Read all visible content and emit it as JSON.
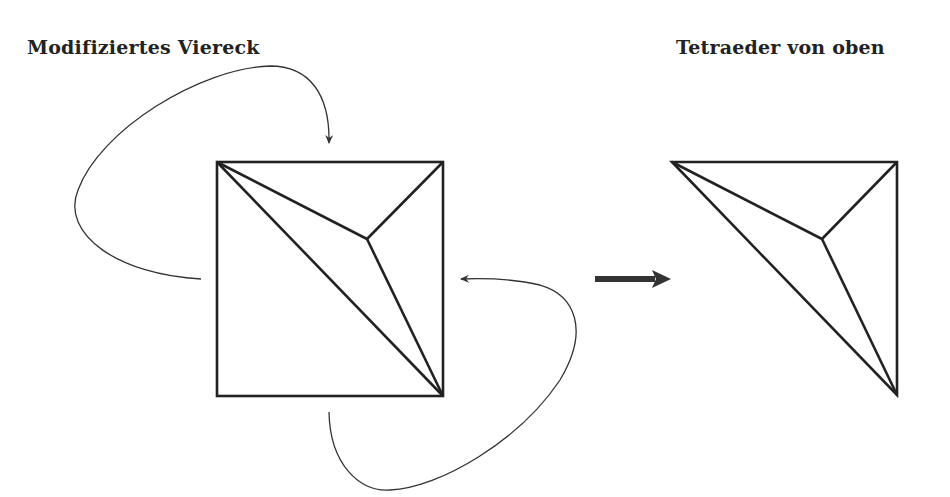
{
  "titles": {
    "left": "Modifiziertes Viereck",
    "right": "Tetraeder von oben"
  },
  "colors": {
    "stroke": "#222222",
    "background": "#ffffff"
  },
  "diagram": {
    "left_figure": {
      "name": "modified square",
      "square": {
        "x1": 217,
        "y1": 162,
        "x2": 443,
        "y2": 396
      },
      "interior_point": [
        367,
        239
      ],
      "edges": [
        [
          [
            217,
            162
          ],
          [
            443,
            396
          ]
        ],
        [
          [
            217,
            162
          ],
          [
            367,
            239
          ]
        ],
        [
          [
            443,
            162
          ],
          [
            367,
            239
          ]
        ],
        [
          [
            367,
            239
          ],
          [
            443,
            396
          ]
        ]
      ],
      "curved_arrows": [
        {
          "from": "left side",
          "to": "top side",
          "direction": "clockwise"
        },
        {
          "from": "bottom side",
          "to": "right side",
          "direction": "counterclockwise"
        }
      ]
    },
    "transition_arrow": {
      "from": [
        595,
        279
      ],
      "to": [
        671,
        279
      ]
    },
    "right_figure": {
      "name": "tetrahedron top view",
      "vertices": [
        [
          672,
          162
        ],
        [
          897,
          162
        ],
        [
          897,
          395
        ]
      ],
      "interior_point": [
        822,
        239
      ]
    }
  }
}
